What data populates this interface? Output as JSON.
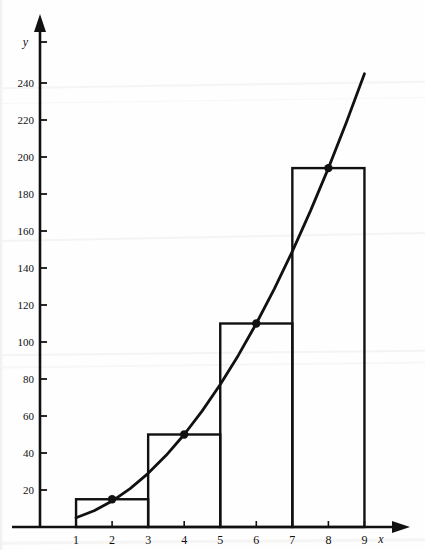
{
  "figure": {
    "background_color": "#fefefe",
    "ink_color": "#111111"
  },
  "chart_data": {
    "type": "area",
    "title": "",
    "xlabel": "x",
    "ylabel": "y",
    "grid": false,
    "legend": null,
    "xlim": [
      0,
      9.8
    ],
    "ylim": [
      0,
      262
    ],
    "x_ticks": [
      1,
      2,
      3,
      4,
      5,
      6,
      7,
      8,
      9
    ],
    "x_tick_labels": [
      "1",
      "2",
      "3",
      "4",
      "5",
      "6",
      "7",
      "8",
      "9"
    ],
    "y_ticks": [
      20,
      40,
      60,
      80,
      100,
      120,
      140,
      160,
      180,
      200,
      220,
      240
    ],
    "y_tick_labels": [
      "20",
      "40",
      "60",
      "80",
      "100",
      "120",
      "140",
      "160",
      "180",
      "200",
      "220",
      "240"
    ],
    "series": [
      {
        "name": "curve",
        "kind": "line",
        "x": [
          1,
          1.5,
          2,
          2.5,
          3,
          3.5,
          4,
          4.5,
          5,
          5.5,
          6,
          6.5,
          7,
          7.5,
          8,
          8.5,
          9
        ],
        "values": [
          5,
          8.75,
          14,
          20.75,
          29,
          38.75,
          50,
          62.75,
          77,
          92.75,
          110,
          128.75,
          149,
          170.75,
          194,
          218.75,
          245
        ]
      },
      {
        "name": "midpoint-rectangles",
        "kind": "bar",
        "intervals": [
          [
            1,
            3
          ],
          [
            3,
            5
          ],
          [
            5,
            7
          ],
          [
            7,
            9
          ]
        ],
        "midpoints": [
          2,
          4,
          6,
          8
        ],
        "values": [
          15,
          50,
          110,
          194
        ]
      },
      {
        "name": "midpoint-markers",
        "kind": "scatter",
        "x": [
          2,
          4,
          6,
          8
        ],
        "values": [
          15,
          50,
          110,
          194
        ]
      }
    ]
  },
  "axes": {
    "y_axis_name": "y",
    "x_axis_name": "x"
  }
}
